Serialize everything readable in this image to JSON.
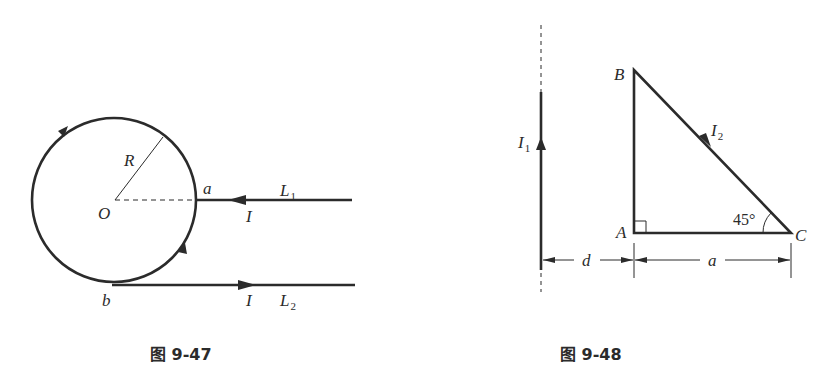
{
  "figures": [
    {
      "caption": "图 9-47",
      "labels": {
        "center": "O",
        "radius": "R",
        "point_a": "a",
        "point_b": "b",
        "current_top": "I",
        "current_bottom": "I",
        "wire1": "L",
        "wire1_sub": "1",
        "wire2": "L",
        "wire2_sub": "2"
      }
    },
    {
      "caption": "图 9-48",
      "labels": {
        "vertex_a": "A",
        "vertex_b": "B",
        "vertex_c": "C",
        "current1": "I",
        "current1_sub": "1",
        "current2": "I",
        "current2_sub": "2",
        "angle": "45°",
        "distance_d": "d",
        "side_a": "a"
      }
    }
  ],
  "colors": {
    "ink": "#2b2b2b",
    "background": "#ffffff"
  }
}
